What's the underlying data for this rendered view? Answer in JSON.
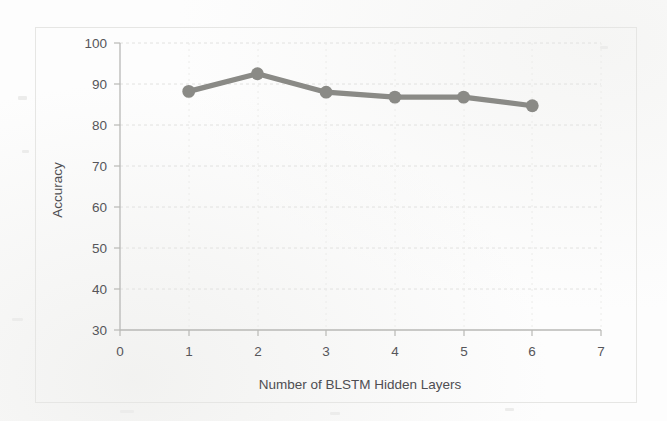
{
  "chart_data": {
    "type": "line",
    "title": "",
    "xlabel": "Number of BLSTM Hidden Layers",
    "ylabel": "Accuracy",
    "x": [
      1,
      2,
      3,
      4,
      5,
      6
    ],
    "values": [
      88.2,
      92.5,
      88.0,
      86.8,
      86.8,
      84.7
    ],
    "series": [
      {
        "name": "Accuracy",
        "values": [
          88.2,
          92.5,
          88.0,
          86.8,
          86.8,
          84.7
        ]
      }
    ],
    "xlim": [
      0,
      7
    ],
    "ylim": [
      30,
      100
    ],
    "x_ticks": [
      "0",
      "1",
      "2",
      "3",
      "4",
      "5",
      "6",
      "7"
    ],
    "y_ticks": [
      "30",
      "40",
      "50",
      "60",
      "70",
      "80",
      "90",
      "100"
    ],
    "grid": true,
    "legend": "none",
    "marker": "circle",
    "line_color": "#8a8a86",
    "marker_color": "#8a8a86",
    "grid_color": "#e2e2e0",
    "axis_color": "#b9b9b6",
    "tick_label_color": "#56565a",
    "background_color": "#fdfdfd"
  }
}
